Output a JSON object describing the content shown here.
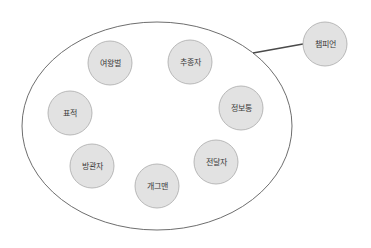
{
  "diagram": {
    "group": {
      "cx": 157,
      "cy": 126,
      "rx": 135,
      "ry": 104,
      "stroke": "#6e6e6e",
      "fill": "#ffffff"
    },
    "node_style": {
      "r": 22,
      "fill": "#e2e2e2",
      "stroke": "#a9a9a9"
    },
    "nodes": [
      {
        "id": "queen-bee",
        "label": "여왕벌",
        "cx": 110,
        "cy": 63
      },
      {
        "id": "follower",
        "label": "추종자",
        "cx": 190,
        "cy": 62
      },
      {
        "id": "informant",
        "label": "정보통",
        "cx": 241,
        "cy": 108
      },
      {
        "id": "target",
        "label": "표적",
        "cx": 70,
        "cy": 113
      },
      {
        "id": "bystander",
        "label": "방관자",
        "cx": 92,
        "cy": 166
      },
      {
        "id": "comedian",
        "label": "개그맨",
        "cx": 157,
        "cy": 186
      },
      {
        "id": "messenger",
        "label": "전달자",
        "cx": 216,
        "cy": 162
      }
    ],
    "external_node": {
      "id": "champion",
      "label": "챔피언",
      "cx": 325,
      "cy": 44
    },
    "connector": {
      "x1": 253,
      "y1": 53,
      "x2": 303,
      "y2": 44,
      "stroke": "#4a4a4a"
    }
  }
}
